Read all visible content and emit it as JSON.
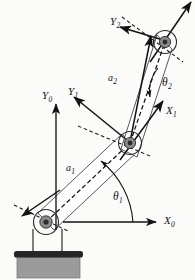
{
  "figure": {
    "type": "line-drawing",
    "background_color": "#fbfbfa",
    "ink_color": "#121212"
  },
  "labels": {
    "y0": {
      "text": "Y",
      "sub": "0",
      "x": 42,
      "y": 90
    },
    "x0": {
      "text": "X",
      "sub": "0",
      "x": 164,
      "y": 215
    },
    "y1": {
      "text": "Y",
      "sub": "1",
      "x": 68,
      "y": 86
    },
    "x1": {
      "text": "X",
      "sub": "1",
      "x": 166,
      "y": 105
    },
    "y2": {
      "text": "Y",
      "sub": "2",
      "x": 110,
      "y": 16
    },
    "a1": {
      "text": "a",
      "sub": "1",
      "x": 66,
      "y": 163
    },
    "a2": {
      "text": "a",
      "sub": "2",
      "x": 108,
      "y": 73
    },
    "theta1": {
      "text": "θ",
      "sub": "1",
      "x": 113,
      "y": 191
    },
    "theta2": {
      "text": "θ",
      "sub": "2",
      "x": 162,
      "y": 77
    }
  },
  "geometry": {
    "joint0": {
      "x": 46,
      "y": 222,
      "label": "base-joint"
    },
    "joint1": {
      "x": 130,
      "y": 143,
      "label": "elbow-joint"
    },
    "joint2": {
      "x": 165,
      "y": 42,
      "label": "tool-joint"
    },
    "link1": {
      "name": "a1",
      "from": "joint0",
      "to": "joint1"
    },
    "link2": {
      "name": "a2",
      "from": "joint1",
      "to": "joint2"
    }
  },
  "base": {
    "plate_color": "#262626",
    "block_color": "#9b9b9b",
    "block_edge_color": "#5a5a5a"
  },
  "joint_style": {
    "ring_color": "#2a2a2a",
    "hub_color": "#6e6e6e",
    "core_color": "#303030"
  }
}
